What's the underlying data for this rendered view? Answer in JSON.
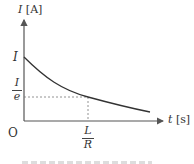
{
  "diagram": {
    "type": "exponential-decay-graph",
    "y_axis": {
      "var": "I",
      "unit": "[A]"
    },
    "x_axis": {
      "var": "t",
      "unit": "[s]"
    },
    "origin_label": "O",
    "y_ticks": {
      "initial": "I",
      "decayed_num": "I",
      "decayed_den": "e"
    },
    "x_ticks": {
      "tau_num": "L",
      "tau_den": "R"
    },
    "curve": "I(t) = I·e^(-Rt/L)",
    "colors": {
      "axis": "#555555",
      "curve": "#333333",
      "dashed": "#777777",
      "text": "#333333"
    }
  },
  "caption": ""
}
